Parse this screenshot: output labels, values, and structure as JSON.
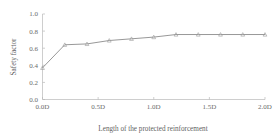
{
  "chart_data": {
    "type": "line",
    "title": "",
    "subtitle": "",
    "xlabel": "Length of the protected reinforcement",
    "ylabel": "Safety factor",
    "x": [
      0.0,
      0.2,
      0.4,
      0.6,
      0.8,
      1.0,
      1.2,
      1.4,
      1.6,
      1.8,
      2.0
    ],
    "xtick_values": [
      0.0,
      0.5,
      1.0,
      1.5,
      2.0
    ],
    "xtick_labels": [
      "0.0D",
      "0.5D",
      "1.0D",
      "1.5D",
      "2.0D"
    ],
    "ytick_values": [
      0.0,
      0.2,
      0.4,
      0.6,
      0.8,
      1.0
    ],
    "ytick_labels": [
      "0.0",
      "0.2",
      "0.4",
      "0.6",
      "0.8",
      "1.0"
    ],
    "xlim": [
      0.0,
      2.0
    ],
    "ylim": [
      0.0,
      1.0
    ],
    "grid": false,
    "legend": null,
    "legend_position": "none",
    "annotations": [],
    "series": [
      {
        "name": "Safety factor",
        "values": [
          0.37,
          0.64,
          0.65,
          0.69,
          0.71,
          0.73,
          0.76,
          0.76,
          0.76,
          0.76,
          0.76
        ],
        "line_color": "#8c8c8c",
        "marker": "triangle",
        "marker_color": "#9a9a9a"
      }
    ]
  },
  "style": {
    "background": "#ffffff",
    "axis_color": "#b9b9b9",
    "text_color": "#5f5f5f"
  }
}
